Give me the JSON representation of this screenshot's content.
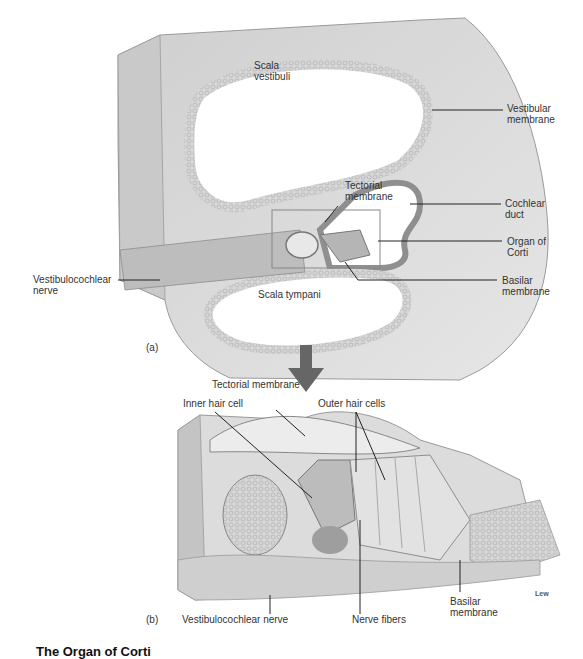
{
  "figure": {
    "caption": "The Organ of Corti",
    "credit": "Lew",
    "panel_a": {
      "label": "(a)",
      "labels": {
        "scala_vestibuli": "Scala vestibuli",
        "scala_vestibuli_line1": "Scala",
        "scala_vestibuli_line2": "vestibuli",
        "tectorial_membrane_line1": "Tectorial",
        "tectorial_membrane_line2": "membrane",
        "scala_tympani": "Scala tympani",
        "vestibular_membrane_line1": "Vestibular",
        "vestibular_membrane_line2": "membrane",
        "cochlear_duct_line1": "Cochlear",
        "cochlear_duct_line2": "duct",
        "organ_of_corti_line1": "Organ of",
        "organ_of_corti_line2": "Corti",
        "basilar_membrane_line1": "Basilar",
        "basilar_membrane_line2": "membrane",
        "vestibulocochlear_nerve_line1": "Vestibulocochlear",
        "vestibulocochlear_nerve_line2": "nerve"
      }
    },
    "panel_b": {
      "label": "(b)",
      "labels": {
        "tectorial_membrane": "Tectorial membrane",
        "inner_hair_cell": "Inner hair cell",
        "outer_hair_cells": "Outer hair cells",
        "vestibulocochlear_nerve": "Vestibulocochlear nerve",
        "nerve_fibers": "Nerve fibers",
        "basilar_membrane_line1": "Basilar",
        "basilar_membrane_line2": "membrane"
      }
    }
  }
}
